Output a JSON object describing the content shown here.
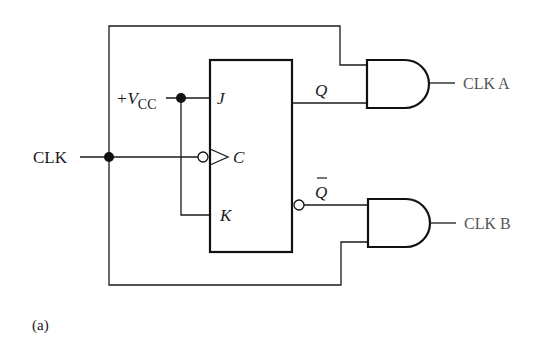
{
  "diagram": {
    "type": "circuit",
    "caption": "(a)",
    "inputs": {
      "clock": "CLK",
      "supply_prefix": "+V",
      "supply_subscript": "CC"
    },
    "flip_flop": {
      "type": "JK",
      "pins": {
        "j": "J",
        "clock": "C",
        "k": "K",
        "q": "Q",
        "q_bar": "Q"
      },
      "clock_edge": "negative"
    },
    "gates": [
      {
        "type": "AND",
        "output_label": "CLK A",
        "inputs": [
          "CLK",
          "Q"
        ]
      },
      {
        "type": "AND",
        "output_label": "CLK B",
        "inputs": [
          "Q_bar",
          "CLK"
        ]
      }
    ],
    "colors": {
      "line": "#111111",
      "output_label": "#555555",
      "background": "#ffffff"
    }
  }
}
